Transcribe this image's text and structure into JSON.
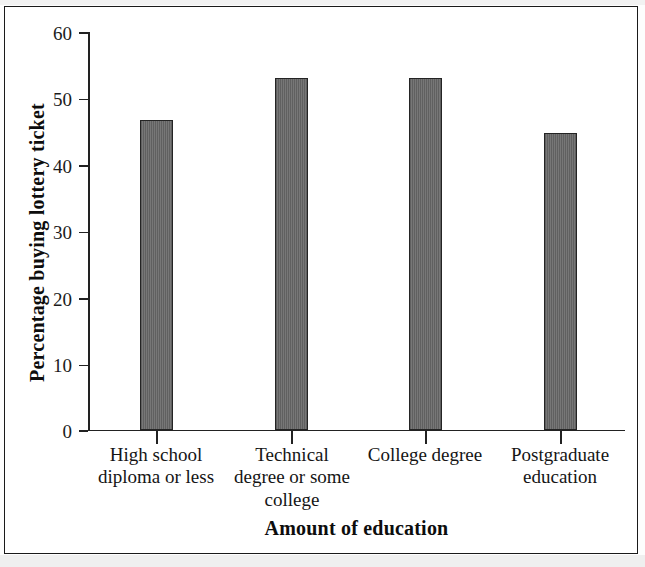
{
  "figure": {
    "frame_color": "#1a1a1a",
    "background": "#ffffff"
  },
  "chart_data": {
    "type": "bar",
    "title": "",
    "subtitle": "",
    "xlabel": "Amount of education",
    "ylabel": "Percentage buying lottery ticket",
    "categories": [
      "High school diploma or less",
      "Technical degree or some college",
      "College degree",
      "Postgraduate education"
    ],
    "category_lines": [
      [
        "High school",
        "diploma or less"
      ],
      [
        "Technical",
        "degree or some",
        "college"
      ],
      [
        "College degree"
      ],
      [
        "Postgraduate",
        "education"
      ]
    ],
    "values": [
      46.8,
      53.0,
      53.0,
      44.7
    ],
    "ylim": [
      0,
      60
    ],
    "yticks": [
      0,
      10,
      20,
      30,
      40,
      50,
      60
    ],
    "ytick_labels": [
      "0",
      "10",
      "20",
      "30",
      "40",
      "50",
      "60"
    ],
    "grid": false,
    "legend": null,
    "bar_color": "#6d6d6d",
    "bar_edge_color": "#242424",
    "series": [
      {
        "name": "Percentage buying lottery ticket",
        "values": [
          46.8,
          53.0,
          53.0,
          44.7
        ]
      }
    ]
  }
}
